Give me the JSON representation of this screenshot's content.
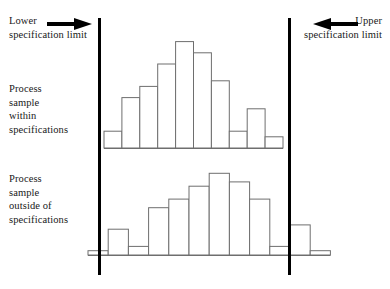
{
  "figure": {
    "width": 390,
    "height": 289,
    "background": "#ffffff",
    "line_color": "#000000",
    "bar_stroke": "#6e6e6e",
    "bar_fill": "#ffffff"
  },
  "labels": {
    "lower_spec": "Lower\nspecification limit",
    "upper_spec": "Upper\nspecification limit",
    "within": "Process\nsample\nwithin\nspecifications",
    "outside": "Process\nsample\noutside of\nspecifications"
  },
  "icons": {
    "lower_arrow": "arrow-right-icon",
    "upper_arrow": "arrow-left-icon"
  },
  "spec_limits": {
    "lower_x": 99.5,
    "upper_x": 289.5,
    "top_y": 18,
    "bottom_y": 275,
    "thickness": 3
  },
  "chart_data": [
    {
      "type": "bar",
      "name": "Process sample within specifications",
      "title": "Process sample within specifications",
      "xlabel": "",
      "ylabel": "",
      "grid": false,
      "legend": false,
      "baseline_y": 148,
      "bar_left": 104,
      "bar_width": 17.9,
      "pixels_per_unit": 5.6,
      "ylim": [
        0,
        19
      ],
      "categories": [
        "1",
        "2",
        "3",
        "4",
        "5",
        "6",
        "7",
        "8",
        "9",
        "10"
      ],
      "values": [
        3,
        9,
        11,
        15,
        19,
        17,
        12,
        3,
        7,
        2
      ],
      "annotation": "All bars fall between the lower and upper specification limits."
    },
    {
      "type": "bar",
      "name": "Process sample outside of specifications",
      "title": "Process sample outside of specifications",
      "xlabel": "",
      "ylabel": "",
      "grid": false,
      "legend": false,
      "baseline_y": 255,
      "bar_left": 88,
      "bar_width": 20.2,
      "pixels_per_unit": 4.3,
      "ylim": [
        0,
        19
      ],
      "categories": [
        "1",
        "2",
        "3",
        "4",
        "5",
        "6",
        "7",
        "8",
        "9",
        "10",
        "11",
        "12"
      ],
      "values": [
        1,
        6,
        2,
        11,
        13,
        16,
        19,
        17,
        13,
        2,
        7,
        1
      ],
      "annotation": "Bars extend past both the lower and upper specification limits."
    }
  ]
}
